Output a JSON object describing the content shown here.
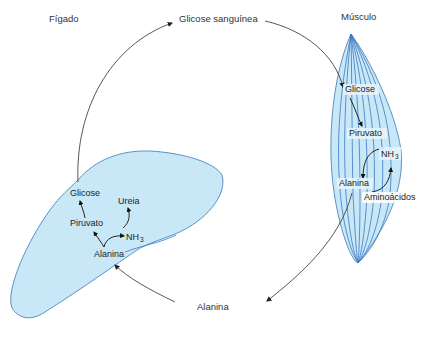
{
  "colors": {
    "organ_fill": "#c9e8f7",
    "organ_stroke": "#4a86c0",
    "fiber_stroke": "#3a78c2",
    "arrow": "#333333",
    "text": "#333333"
  },
  "labels": {
    "liver": "Fígado",
    "muscle": "Músculo",
    "blood_glucose": "Glicose sanguínea",
    "blood_alanine": "Alanina"
  },
  "liver": {
    "glucose": "Glicose",
    "urea": "Ureia",
    "pyruvate": "Piruvato",
    "nh3": "NH",
    "nh3_sub": "3",
    "alanine": "Alanina"
  },
  "muscle": {
    "glucose": "Glicose",
    "pyruvate": "Piruvato",
    "nh3": "NH",
    "nh3_sub": "3",
    "alanine": "Alanina",
    "amino_acids": "Aminoácidos"
  }
}
